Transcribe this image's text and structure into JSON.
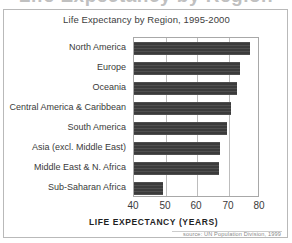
{
  "clipped_heading": "Life Expectancy by Region",
  "figure": {
    "title": "Life Expectancy by Region, 1995-2000",
    "source_note": "source: UN Population Division, 1999"
  },
  "colors": {
    "bar_fill": "#3b3b3b",
    "frame_border": "#b9b9b9",
    "plot_border": "#a8a8a8",
    "gridline": "#bdbdbd",
    "title_text": "#404040",
    "label_text": "#3a3a3a",
    "source_text": "#8a8a8a"
  },
  "chart_data": {
    "type": "bar",
    "orientation": "horizontal",
    "title": "Life Expectancy by Region, 1995-2000",
    "xlabel": "LIFE EXPECTANCY (YEARS)",
    "ylabel": "",
    "xlim": [
      40,
      80
    ],
    "xticks": [
      40,
      50,
      60,
      70,
      80
    ],
    "xticklabels": [
      "40",
      "50",
      "60",
      "70",
      "80"
    ],
    "grid": "vertical",
    "legend": false,
    "source": "source: UN Population Division, 1999",
    "categories": [
      "North America",
      "Europe",
      "Oceania",
      "Central America & Caribbean",
      "South America",
      "Asia (excl. Middle East)",
      "Middle East & N. Africa",
      "Sub-Saharan Africa"
    ],
    "values": [
      76.8,
      73.7,
      72.6,
      70.8,
      69.4,
      67.3,
      67.0,
      49.3
    ]
  }
}
